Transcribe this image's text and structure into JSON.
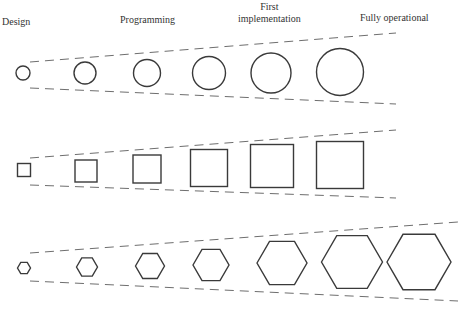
{
  "diagram": {
    "stage_labels": [
      {
        "text": "Design",
        "x": 2,
        "y": 16
      },
      {
        "text": "Programming",
        "x": 120,
        "y": 14
      },
      {
        "text": "First\nimplementation",
        "x": 240,
        "y": 1
      },
      {
        "text": "Fully operational",
        "x": 360,
        "y": 12
      }
    ],
    "colors": {
      "shape_stroke": "#3a3a3a",
      "guide_stroke": "#6e6e6e",
      "label_text": "#333333",
      "background": "#ffffff"
    },
    "rows": [
      {
        "name": "circles",
        "shape": "circle",
        "guides": {
          "top": [
            30,
            62,
            396,
            33
          ],
          "bottom": [
            30,
            88,
            396,
            104
          ]
        },
        "items": [
          {
            "cx": 23,
            "cy": 73,
            "size": 14
          },
          {
            "cx": 85,
            "cy": 73,
            "size": 22
          },
          {
            "cx": 147,
            "cy": 73,
            "size": 27
          },
          {
            "cx": 209,
            "cy": 73,
            "size": 33
          },
          {
            "cx": 271,
            "cy": 73,
            "size": 40
          },
          {
            "cx": 340,
            "cy": 72,
            "size": 47
          }
        ]
      },
      {
        "name": "squares",
        "shape": "square",
        "guides": {
          "top": [
            30,
            158,
            396,
            130
          ],
          "bottom": [
            30,
            185,
            396,
            198
          ]
        },
        "items": [
          {
            "cx": 24,
            "cy": 170,
            "size": 13
          },
          {
            "cx": 86,
            "cy": 171,
            "size": 22
          },
          {
            "cx": 147,
            "cy": 169,
            "size": 28
          },
          {
            "cx": 209,
            "cy": 168,
            "size": 37
          },
          {
            "cx": 272,
            "cy": 166,
            "size": 43
          },
          {
            "cx": 340,
            "cy": 165,
            "size": 47
          }
        ]
      },
      {
        "name": "hexagons",
        "shape": "hexagon",
        "guides": {
          "top": [
            30,
            253,
            458,
            222
          ],
          "bottom": [
            30,
            281,
            458,
            301
          ]
        },
        "items": [
          {
            "cx": 24,
            "cy": 268,
            "size": 13
          },
          {
            "cx": 87,
            "cy": 267,
            "size": 21
          },
          {
            "cx": 150,
            "cy": 266,
            "size": 29
          },
          {
            "cx": 211,
            "cy": 265,
            "size": 36
          },
          {
            "cx": 282,
            "cy": 263,
            "size": 50
          },
          {
            "cx": 352,
            "cy": 262,
            "size": 61
          },
          {
            "cx": 419,
            "cy": 262,
            "size": 64
          }
        ]
      }
    ]
  }
}
